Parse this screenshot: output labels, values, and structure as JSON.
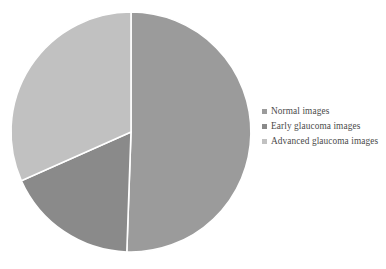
{
  "chart_data": {
    "type": "pie",
    "title": "",
    "categories": [
      "Normal images",
      "Early glaucoma images",
      "Advanced glaucoma images"
    ],
    "values": [
      50.6,
      17.8,
      31.6
    ],
    "units": "percent",
    "colors": [
      "#9b9b9b",
      "#8a8a8a",
      "#c1c1c1"
    ],
    "legend_position": "right",
    "grid": false,
    "labels_shown": false,
    "start_angle_deg": 0,
    "direction": "clockwise",
    "slices": [
      {
        "label": "Normal images",
        "value": 50.6,
        "color": "#9b9b9b",
        "start_angle_deg": 0,
        "end_angle_deg": 182
      },
      {
        "label": "Early glaucoma images",
        "value": 17.8,
        "color": "#8a8a8a",
        "start_angle_deg": 182,
        "end_angle_deg": 246
      },
      {
        "label": "Advanced glaucoma images",
        "value": 31.6,
        "color": "#c1c1c1",
        "start_angle_deg": 246,
        "end_angle_deg": 360
      }
    ]
  },
  "legend": {
    "items": [
      {
        "label": "Normal images",
        "color": "#9b9b9b",
        "marker": "square-marker"
      },
      {
        "label": "Early glaucoma images",
        "color": "#8a8a8a",
        "marker": "square-marker"
      },
      {
        "label": "Advanced glaucoma images",
        "color": "#c1c1c1",
        "marker": "square-marker"
      }
    ]
  },
  "canvas": {
    "background": "#ffffff",
    "separator_color": "#ffffff",
    "center_x": 131,
    "center_y": 132,
    "radius": 120
  }
}
